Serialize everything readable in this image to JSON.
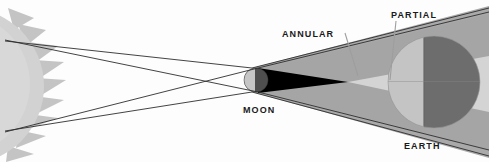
{
  "diagram": {
    "labels": {
      "sun": "",
      "moon": "MOON",
      "earth": "EARTH",
      "annular": "ANNULAR",
      "partial": "PARTIAL"
    },
    "colors": {
      "background": "#fdfdfd",
      "sun_body": "#cfcfcf",
      "sun_rays": "#bdbdbd",
      "penumbra": "#a8a8a8",
      "antumbra": "#d2d2d2",
      "umbra": "#000000",
      "moon_light": "#c9c9c9",
      "moon_dark": "#4a4a4a",
      "earth_day": "#cfcfcf",
      "earth_night": "#6a6a6a",
      "earth_shadowed": "#8e8e8e",
      "ray_line": "#3a3a3a",
      "leader_line": "#9a9a9a",
      "label_text": "#1a1a1a"
    },
    "bodies": [
      {
        "name": "sun",
        "cx": -34,
        "cy": 86,
        "r": 78,
        "ray_count": 14
      },
      {
        "name": "moon",
        "cx": 256,
        "cy": 80,
        "r": 12
      },
      {
        "name": "earth",
        "cx": 434,
        "cy": 82,
        "r": 46,
        "terminator_x": 424
      }
    ],
    "shadow_regions": [
      {
        "name": "umbra",
        "kind": "cone",
        "apex_x": 348,
        "apex_y": 82
      },
      {
        "name": "antumbra",
        "kind": "diverging-cone",
        "from_x": 348
      },
      {
        "name": "penumbra",
        "kind": "diverging-cone",
        "from_x": 256
      }
    ],
    "light_rays": [
      {
        "from": "sun-top",
        "x1": 5,
        "y1": 40
      },
      {
        "from": "sun-bottom",
        "x1": 5,
        "y1": 132
      }
    ]
  }
}
